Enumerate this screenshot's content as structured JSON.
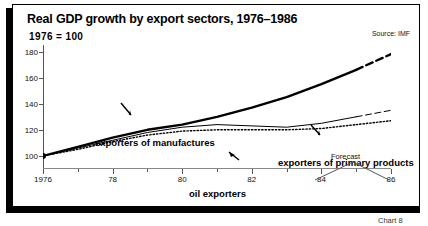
{
  "header": {
    "title": "Real GDP growth by export sectors, 1976–1986",
    "index_note": "1976 = 100",
    "source": "Source: IMF"
  },
  "caption": "Chart 8",
  "forecast": {
    "label": "Forecast"
  },
  "colors": {
    "ink": "#000000",
    "frame": "#555555",
    "background": "#ffffff"
  },
  "chart_data": {
    "type": "line",
    "title": "Real GDP growth by export sectors, 1976–1986",
    "subtitle": "1976 = 100",
    "source": "Source: IMF",
    "xlabel": "",
    "ylabel": "",
    "xlim": [
      1976,
      1986
    ],
    "ylim": [
      90,
      185
    ],
    "yticks": [
      100,
      120,
      140,
      160,
      180
    ],
    "ytick_labels": [
      "100",
      "120",
      "140",
      "160",
      "180"
    ],
    "xticks": [
      1976,
      1978,
      1980,
      1982,
      1984,
      1986
    ],
    "xtick_labels": [
      "1976",
      "78",
      "80",
      "82",
      "84",
      "86"
    ],
    "xticks_minor": [
      1977,
      1979,
      1981,
      1983,
      1985
    ],
    "grid": false,
    "legend": "inline-annotations",
    "forecast_from": 1985,
    "annotations": [
      {
        "text": "Forecast",
        "x": 1985.5,
        "note": "caret bracket spanning 1985–1986 below axis region"
      }
    ],
    "x": [
      1976,
      1977,
      1978,
      1979,
      1980,
      1981,
      1982,
      1983,
      1984,
      1985,
      1986
    ],
    "series": [
      {
        "name": "exporters of manufactures",
        "style": "thick-solid-with-dashed-forecast",
        "values": [
          100,
          107,
          114,
          120,
          124,
          130,
          137,
          145,
          155,
          166,
          178
        ]
      },
      {
        "name": "exporters of primary products",
        "style": "thin-solid-with-dashed-forecast",
        "values": [
          100,
          106,
          112,
          118,
          122,
          124,
          123,
          122,
          125,
          130,
          135
        ]
      },
      {
        "name": "oil exporters",
        "style": "dotted",
        "values": [
          100,
          105,
          111,
          116,
          119,
          120,
          120,
          120,
          121,
          124,
          127
        ]
      }
    ]
  }
}
